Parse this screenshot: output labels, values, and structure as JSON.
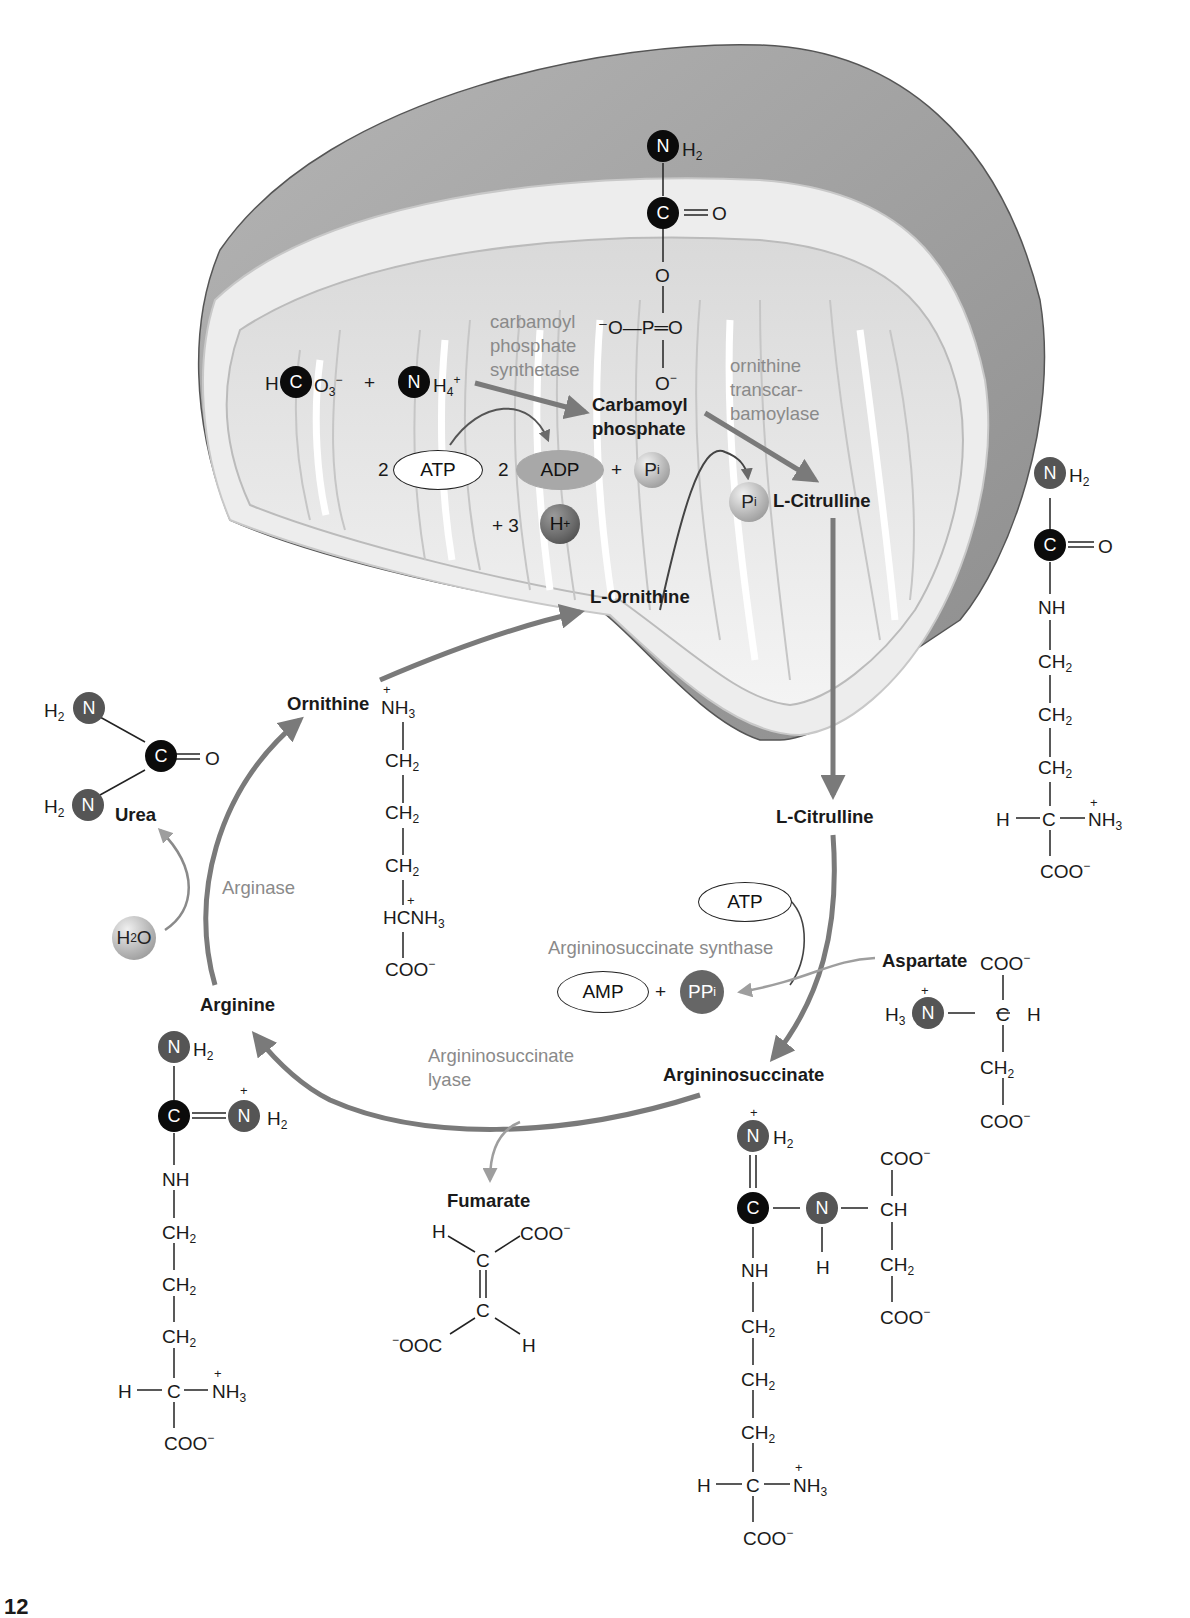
{
  "diagram": {
    "type": "urea-cycle",
    "colors": {
      "arrow": "#7a7a7a",
      "enzyme_text": "#8a8a8a",
      "carbon_atom": "#0b0b0b",
      "nitrogen_atom": "#555555",
      "mito_outer": "#9c9c9c",
      "mito_inner": "#e4e4e4"
    }
  },
  "mitochondrion": {
    "carbamoyl_phosphate_struct": {
      "n": "N",
      "h2": "H",
      "h2_sub": "2",
      "c": "C",
      "eq_o": "═O",
      "o_link": "O",
      "p_row": "⁻O—P═O",
      "o_minus": "O",
      "o_minus_sup": "−"
    },
    "bicarbonate": {
      "h": "H",
      "c": "C",
      "o": "O",
      "o_sub": "3",
      "o_sup": "−"
    },
    "plus1": "+",
    "ammonium": {
      "n": "N",
      "h": "H",
      "h_sub": "4",
      "h_sup": "+"
    },
    "enzyme_cps": [
      "carbamoyl",
      "phosphate",
      "synthetase"
    ],
    "enzyme_otc": [
      "ornithine",
      "transcar-",
      "bamoylase"
    ],
    "carbamoyl_phosphate_label": [
      "Carbamoyl",
      "phosphate"
    ],
    "atp_coeff": "2",
    "atp": "ATP",
    "adp_coeff": "2",
    "adp": "ADP",
    "plus2": "+",
    "pi1": {
      "p": "P",
      "sub": "i"
    },
    "plus3": "+ 3",
    "hplus": {
      "h": "H",
      "sup": "+"
    },
    "pi2": {
      "p": "P",
      "sub": "i"
    },
    "citrulline_in": {
      "prefix": "L",
      "name": "-Citrulline"
    },
    "ornithine_in": {
      "prefix": "L",
      "name": "-Ornithine"
    }
  },
  "citrulline_struct": {
    "n": "N",
    "h2": "H",
    "h2_sub": "2",
    "c": "C",
    "eq_o": "═O",
    "nh": "NH",
    "ch2": [
      "CH",
      "CH",
      "CH"
    ],
    "ch2_sub": "2",
    "alpha": "H—C—",
    "nh3": "NH",
    "nh3_sub": "3",
    "nh3_sup": "+",
    "coo": "COO",
    "coo_sup": "−"
  },
  "cytosol": {
    "citrulline_out": {
      "prefix": "L",
      "name": "-Citrulline"
    },
    "atp": "ATP",
    "enzyme_ass": "Argininosuccinate synthase",
    "amp": "AMP",
    "plus": "+",
    "ppi": {
      "p": "PP",
      "sub": "i"
    },
    "aspartate": {
      "label": "Aspartate",
      "coo_top": "COO",
      "coo_sup": "−",
      "h3": "H",
      "h3_sub": "3",
      "n": "N",
      "n_sup": "+",
      "c_row": "—C—H",
      "ch2": "CH",
      "ch2_sub": "2",
      "coo_bottom": "COO"
    },
    "argininosuccinate": {
      "label": "Argininosuccinate",
      "n_top": "N",
      "n_top_sup": "+",
      "h2": "H",
      "h2_sub": "2",
      "eq": "‖",
      "c": "C",
      "n_mid": "N",
      "ch": "CH",
      "h_under_n": "H",
      "coo_top": "COO",
      "coo_sup": "−",
      "ch2_side": "CH",
      "ch2_sub": "2",
      "coo_side": "COO",
      "nh": "NH",
      "ch2": [
        "CH",
        "CH",
        "CH"
      ],
      "alpha": "H—C—",
      "nh3": "NH",
      "nh3_sub": "3",
      "nh3_sup": "+",
      "coo": "COO"
    },
    "enzyme_asl": [
      "Argininosuccinate",
      "lyase"
    ],
    "fumarate": {
      "label": "Fumarate",
      "h1": "H",
      "coo1": "COO",
      "coo_sup": "−",
      "c1": "C",
      "c2": "C",
      "coo2_pre": "−",
      "coo2": "OOC",
      "h2": "H"
    },
    "arginine": {
      "label": "Arginine",
      "n_top": "N",
      "h2": "H",
      "h2_sub": "2",
      "c": "C",
      "n_right": "N",
      "n_right_sup": "+",
      "nh": "NH",
      "ch2": [
        "CH",
        "CH",
        "CH"
      ],
      "ch2_sub": "2",
      "alpha": "H—C—",
      "nh3": "NH",
      "nh3_sub": "3",
      "nh3_sup": "+",
      "coo": "COO",
      "coo_sup": "−"
    },
    "enzyme_arginase": "Arginase",
    "water": {
      "h": "H",
      "sub": "2",
      "o": "O"
    },
    "urea": {
      "label": "Urea",
      "h2a": "H",
      "h2_sub": "2",
      "na": "N",
      "h2b": "H",
      "nb": "N",
      "c": "C",
      "eq_o": "═O"
    },
    "ornithine": {
      "label": "Ornithine",
      "nh3": "NH",
      "nh3_sub": "3",
      "nh3_sup": "+",
      "ch2": [
        "CH",
        "CH",
        "CH"
      ],
      "ch2_sub": "2",
      "hc": "HC",
      "nh3b": "NH",
      "coo": "COO",
      "coo_sup": "−"
    }
  },
  "page_fragment": "12"
}
